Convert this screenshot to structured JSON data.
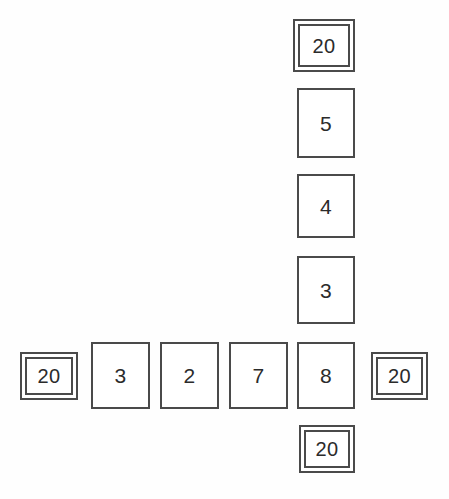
{
  "diagram": {
    "type": "cross-grid",
    "shape": "plus",
    "background_color": "#fefefe",
    "border_color": "#4a4a4a",
    "text_color": "#2b2b2b",
    "sentinel_value": "20",
    "column": {
      "label": "vertical-sequence",
      "cells": [
        {
          "value": "20",
          "style": "double",
          "x": 293,
          "y": 19,
          "w": 62,
          "h": 53
        },
        {
          "value": "5",
          "style": "plain",
          "x": 297,
          "y": 88,
          "w": 58,
          "h": 70
        },
        {
          "value": "4",
          "style": "plain",
          "x": 297,
          "y": 174,
          "w": 58,
          "h": 64
        },
        {
          "value": "3",
          "style": "plain",
          "x": 297,
          "y": 256,
          "w": 58,
          "h": 68
        }
      ]
    },
    "row": {
      "label": "horizontal-sequence",
      "cells": [
        {
          "value": "20",
          "style": "double",
          "x": 20,
          "y": 352,
          "w": 58,
          "h": 48
        },
        {
          "value": "3",
          "style": "plain",
          "x": 91,
          "y": 342,
          "w": 59,
          "h": 67
        },
        {
          "value": "2",
          "style": "plain",
          "x": 160,
          "y": 342,
          "w": 59,
          "h": 67
        },
        {
          "value": "7",
          "style": "plain",
          "x": 229,
          "y": 342,
          "w": 59,
          "h": 67
        },
        {
          "value": "20",
          "style": "double",
          "x": 371,
          "y": 352,
          "w": 57,
          "h": 48
        }
      ]
    },
    "intersection": {
      "label": "shared-cell",
      "cell": {
        "value": "8",
        "style": "plain",
        "x": 297,
        "y": 342,
        "w": 58,
        "h": 67
      }
    },
    "bottom": {
      "label": "bottom-sentinel",
      "cell": {
        "value": "20",
        "style": "double",
        "x": 299,
        "y": 425,
        "w": 56,
        "h": 48
      }
    }
  }
}
